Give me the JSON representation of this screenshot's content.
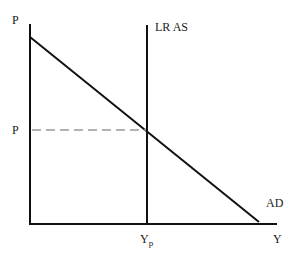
{
  "diagram": {
    "title": "",
    "axes": {
      "y_label": "P",
      "x_label": "Y"
    },
    "curves": {
      "lras_label": "LR AS",
      "ad_label": "AD"
    },
    "markers": {
      "price_level_label": "P",
      "potential_output_label": "Y",
      "potential_output_subscript": "p"
    },
    "colors": {
      "line": "#111111",
      "dashed": "#9a9a9a",
      "background": "#ffffff"
    }
  }
}
